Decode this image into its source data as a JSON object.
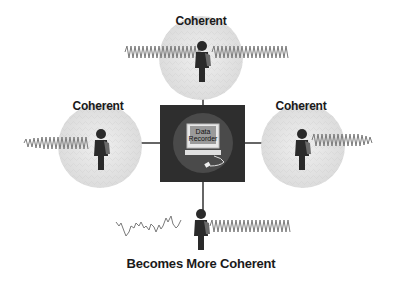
{
  "diagram": {
    "center": {
      "title_line1": "Data",
      "title_line2": "Recorder",
      "icon": "computer-icon"
    },
    "nodes": [
      {
        "id": "top",
        "label": "Coherent",
        "signal": "coherent-wave",
        "icon": "person-icon"
      },
      {
        "id": "left",
        "label": "Coherent",
        "signal": "coherent-wave",
        "icon": "person-icon"
      },
      {
        "id": "right",
        "label": "Coherent",
        "signal": "coherent-wave",
        "icon": "person-icon"
      },
      {
        "id": "bottom",
        "label": "Becomes More Coherent",
        "signal": "noisy-to-coherent-wave",
        "icon": "person-icon"
      }
    ],
    "colors": {
      "box": "#2e2e2e",
      "circle": "#e6e6e6",
      "person": "#2a2a2a",
      "wave": "#7a7a7a",
      "line": "#333333"
    }
  }
}
